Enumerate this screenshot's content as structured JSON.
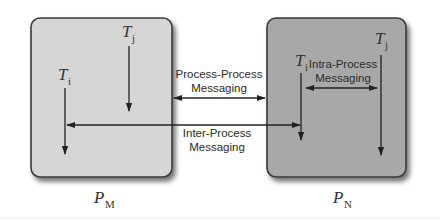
{
  "diagram": {
    "processes": [
      {
        "id": "PM",
        "label": "P",
        "subscript": "M",
        "fill": "#d4d4d4",
        "threads": [
          {
            "label": "T",
            "subscript": "j"
          },
          {
            "label": "T",
            "subscript": "i"
          }
        ]
      },
      {
        "id": "PN",
        "label": "P",
        "subscript": "N",
        "fill": "#a6a6a6",
        "threads": [
          {
            "label": "T",
            "subscript": "i"
          },
          {
            "label": "T",
            "subscript": "j"
          }
        ]
      }
    ],
    "messages": {
      "process_process": {
        "line1": "Process-Process",
        "line2": "Messaging"
      },
      "inter_process": {
        "line1": "Inter-Process",
        "line2": "Messaging"
      },
      "intra_process": {
        "line1": "Intra-Process",
        "line2": "Messaging"
      }
    },
    "colors": {
      "border": "#3a3a3a",
      "arrow": "#222222",
      "shadow": "#555555"
    }
  }
}
